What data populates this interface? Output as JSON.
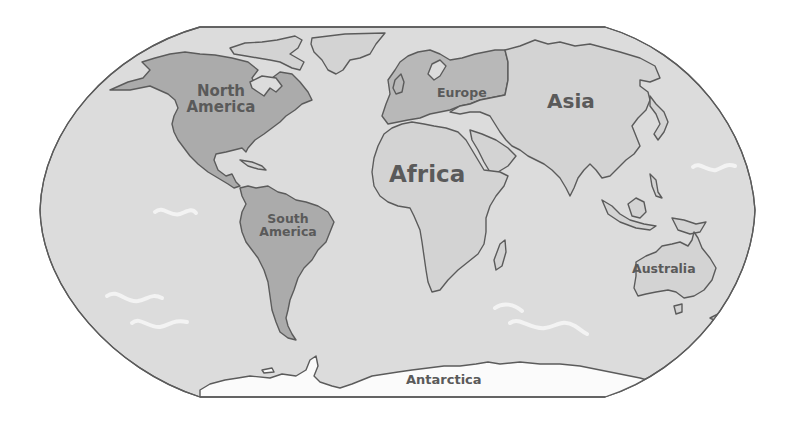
{
  "map": {
    "projection_shape": "robinson",
    "colors": {
      "background": "#ffffff",
      "ocean": "#dcdcdc",
      "land": "#d3d3d3",
      "highlight_land": "#ababab",
      "europe": "#b8b8b8",
      "antarctica": "#fbfbfb",
      "outline": "#5b5b5b",
      "label": "#5a5a5a",
      "waves": "#f2f2f2"
    },
    "continents": [
      {
        "id": "north-america",
        "label_line1": "North",
        "label_line2": "America"
      },
      {
        "id": "south-america",
        "label_line1": "South",
        "label_line2": "America"
      },
      {
        "id": "europe",
        "label": "Europe"
      },
      {
        "id": "asia",
        "label": "Asia"
      },
      {
        "id": "africa",
        "label": "Africa"
      },
      {
        "id": "australia",
        "label": "Australia"
      },
      {
        "id": "antarctica",
        "label": "Antarctica"
      }
    ]
  }
}
